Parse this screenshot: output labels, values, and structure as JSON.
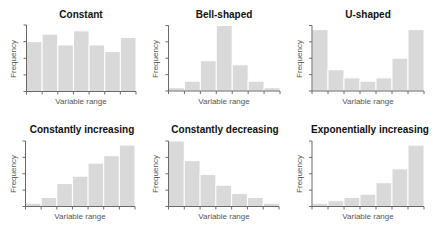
{
  "chart_data": [
    {
      "type": "bar",
      "title": "Constant",
      "xlabel": "Variable range",
      "ylabel": "Frequency",
      "categories": [
        "1",
        "2",
        "3",
        "4",
        "5",
        "6",
        "7"
      ],
      "values": [
        3.0,
        3.45,
        2.8,
        3.65,
        2.8,
        2.4,
        3.25
      ],
      "ylim": [
        0,
        4
      ],
      "grid": false,
      "tick_labels_shown": false
    },
    {
      "type": "bar",
      "title": "Bell-shaped",
      "xlabel": "Variable range",
      "ylabel": "Frequency",
      "categories": [
        "1",
        "2",
        "3",
        "4",
        "5",
        "6",
        "7"
      ],
      "values": [
        0.2,
        0.6,
        1.85,
        4.0,
        1.6,
        0.6,
        0.2
      ],
      "ylim": [
        0,
        4
      ],
      "grid": false,
      "tick_labels_shown": false
    },
    {
      "type": "bar",
      "title": "U-shaped",
      "xlabel": "Variable range",
      "ylabel": "Frequency",
      "categories": [
        "1",
        "2",
        "3",
        "4",
        "5",
        "6",
        "7"
      ],
      "values": [
        3.75,
        1.3,
        0.8,
        0.6,
        0.8,
        2.0,
        3.75
      ],
      "ylim": [
        0,
        4
      ],
      "grid": false,
      "tick_labels_shown": false
    },
    {
      "type": "bar",
      "title": "Constantly increasing",
      "xlabel": "Variable range",
      "ylabel": "Frequency",
      "categories": [
        "1",
        "2",
        "3",
        "4",
        "5",
        "6",
        "7"
      ],
      "values": [
        0.2,
        0.55,
        1.4,
        1.85,
        2.65,
        3.1,
        3.75
      ],
      "ylim": [
        0,
        4
      ],
      "grid": false,
      "tick_labels_shown": false
    },
    {
      "type": "bar",
      "title": "Constantly decreasing",
      "xlabel": "Variable range",
      "ylabel": "Frequency",
      "categories": [
        "1",
        "2",
        "3",
        "4",
        "5",
        "6",
        "7"
      ],
      "values": [
        4.0,
        2.8,
        1.95,
        1.3,
        0.8,
        0.55,
        0.2
      ],
      "ylim": [
        0,
        4
      ],
      "grid": false,
      "tick_labels_shown": false
    },
    {
      "type": "bar",
      "title": "Exponentially increasing",
      "xlabel": "Variable range",
      "ylabel": "Frequency",
      "categories": [
        "1",
        "2",
        "3",
        "4",
        "5",
        "6",
        "7"
      ],
      "values": [
        0.2,
        0.35,
        0.55,
        0.75,
        1.45,
        2.3,
        3.75
      ],
      "ylim": [
        0,
        4
      ],
      "grid": false,
      "tick_labels_shown": false
    }
  ],
  "style": {
    "bar_color": "#d9d9d9",
    "axis_color": "#6a6a6a",
    "title_color": "#111111",
    "label_color": "#555555"
  }
}
